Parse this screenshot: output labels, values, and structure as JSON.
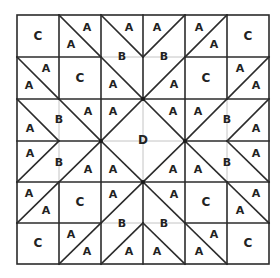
{
  "diagram": {
    "type": "quilt-block-pattern",
    "grid": {
      "rows": 6,
      "cols": 6
    },
    "colors": {
      "line": "#2b2b2b",
      "inner_line": "#c4c4c4",
      "text": "#222222",
      "background": "#ffffff"
    },
    "piece_types": [
      "A",
      "B",
      "C",
      "D"
    ],
    "labels": [
      {
        "id": "r0c0",
        "text": "C",
        "x": 38,
        "y": 36
      },
      {
        "id": "r0c1a",
        "text": "A",
        "x": 87,
        "y": 27
      },
      {
        "id": "r0c1b",
        "text": "A",
        "x": 71,
        "y": 44
      },
      {
        "id": "r0c2a",
        "text": "A",
        "x": 129,
        "y": 27
      },
      {
        "id": "r0c2b",
        "text": "B",
        "x": 122,
        "y": 56
      },
      {
        "id": "r0c3a",
        "text": "A",
        "x": 157,
        "y": 27
      },
      {
        "id": "r0c3b",
        "text": "B",
        "x": 164,
        "y": 56
      },
      {
        "id": "r0c4a",
        "text": "A",
        "x": 199,
        "y": 27
      },
      {
        "id": "r0c4b",
        "text": "A",
        "x": 214,
        "y": 44
      },
      {
        "id": "r0c5",
        "text": "C",
        "x": 248,
        "y": 36
      },
      {
        "id": "r1c0a",
        "text": "A",
        "x": 46,
        "y": 68
      },
      {
        "id": "r1c0b",
        "text": "A",
        "x": 29,
        "y": 85
      },
      {
        "id": "r1c1",
        "text": "C",
        "x": 80,
        "y": 78
      },
      {
        "id": "r1c2",
        "text": "A",
        "x": 113,
        "y": 84
      },
      {
        "id": "r1c3",
        "text": "A",
        "x": 174,
        "y": 84
      },
      {
        "id": "r1c4",
        "text": "C",
        "x": 206,
        "y": 78
      },
      {
        "id": "r1c5a",
        "text": "A",
        "x": 240,
        "y": 68
      },
      {
        "id": "r1c5b",
        "text": "A",
        "x": 256,
        "y": 85
      },
      {
        "id": "r2c0",
        "text": "A",
        "x": 30,
        "y": 128
      },
      {
        "id": "r2c0b",
        "text": "B",
        "x": 59,
        "y": 119
      },
      {
        "id": "r2c1",
        "text": "A",
        "x": 88,
        "y": 111
      },
      {
        "id": "r2c2",
        "text": "A",
        "x": 113,
        "y": 111
      },
      {
        "id": "r2c3",
        "text": "A",
        "x": 173,
        "y": 111
      },
      {
        "id": "r2c4",
        "text": "A",
        "x": 198,
        "y": 111
      },
      {
        "id": "r2c5b",
        "text": "B",
        "x": 227,
        "y": 119
      },
      {
        "id": "r2c5",
        "text": "A",
        "x": 256,
        "y": 128
      },
      {
        "id": "r3c0",
        "text": "A",
        "x": 30,
        "y": 153
      },
      {
        "id": "r3c0b",
        "text": "B",
        "x": 59,
        "y": 162
      },
      {
        "id": "r3c1",
        "text": "A",
        "x": 88,
        "y": 169
      },
      {
        "id": "r3c2",
        "text": "A",
        "x": 113,
        "y": 169
      },
      {
        "id": "r3c3",
        "text": "A",
        "x": 173,
        "y": 169
      },
      {
        "id": "r3c4",
        "text": "A",
        "x": 198,
        "y": 169
      },
      {
        "id": "r3c5b",
        "text": "B",
        "x": 227,
        "y": 162
      },
      {
        "id": "r3c5",
        "text": "A",
        "x": 256,
        "y": 153
      },
      {
        "id": "r4c0a",
        "text": "A",
        "x": 29,
        "y": 193
      },
      {
        "id": "r4c0b",
        "text": "A",
        "x": 46,
        "y": 210
      },
      {
        "id": "r4c1",
        "text": "C",
        "x": 80,
        "y": 202
      },
      {
        "id": "r4c2",
        "text": "A",
        "x": 113,
        "y": 194
      },
      {
        "id": "r4c3",
        "text": "A",
        "x": 174,
        "y": 194
      },
      {
        "id": "r4c4",
        "text": "C",
        "x": 206,
        "y": 202
      },
      {
        "id": "r4c5a",
        "text": "A",
        "x": 256,
        "y": 193
      },
      {
        "id": "r4c5b",
        "text": "A",
        "x": 240,
        "y": 210
      },
      {
        "id": "r5c0",
        "text": "C",
        "x": 38,
        "y": 243
      },
      {
        "id": "r5c1a",
        "text": "A",
        "x": 71,
        "y": 234
      },
      {
        "id": "r5c1b",
        "text": "A",
        "x": 87,
        "y": 251
      },
      {
        "id": "r5c2b",
        "text": "B",
        "x": 122,
        "y": 223
      },
      {
        "id": "r5c2a",
        "text": "A",
        "x": 129,
        "y": 251
      },
      {
        "id": "r5c3b",
        "text": "B",
        "x": 164,
        "y": 223
      },
      {
        "id": "r5c3a",
        "text": "A",
        "x": 157,
        "y": 251
      },
      {
        "id": "r5c4a",
        "text": "A",
        "x": 214,
        "y": 234
      },
      {
        "id": "r5c4b",
        "text": "A",
        "x": 199,
        "y": 251
      },
      {
        "id": "r5c5",
        "text": "C",
        "x": 248,
        "y": 243
      },
      {
        "id": "center",
        "text": "D",
        "x": 143,
        "y": 140
      }
    ]
  }
}
